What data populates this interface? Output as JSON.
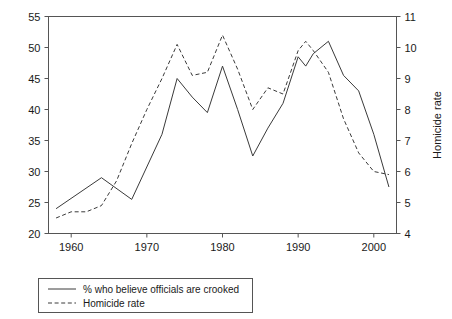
{
  "chart_data": {
    "type": "line",
    "title": "",
    "xlabel": "",
    "ylabel": "",
    "ylabel_right": "Homicide rate",
    "grid": false,
    "legend_position": "bottom-left",
    "xlim": [
      1957,
      2003
    ],
    "xticks": [
      1960,
      1970,
      1980,
      1990,
      2000
    ],
    "xtick_labels": [
      "1960",
      "1970",
      "1980",
      "1990",
      "2000"
    ],
    "ylim_left": [
      20,
      55
    ],
    "yticks_left": [
      20,
      25,
      30,
      35,
      40,
      45,
      50,
      55
    ],
    "ytick_labels_left": [
      "20",
      "25",
      "30",
      "35",
      "40",
      "45",
      "50",
      "55"
    ],
    "ylim_right": [
      4,
      11
    ],
    "yticks_right": [
      4,
      5,
      6,
      7,
      8,
      9,
      10,
      11
    ],
    "ytick_labels_right": [
      "4",
      "5",
      "6",
      "7",
      "8",
      "9",
      "10",
      "11"
    ],
    "series": [
      {
        "name": "% who believe officials are crooked",
        "style": "solid",
        "axis": "left",
        "x": [
          1958,
          1964,
          1968,
          1972,
          1974,
          1976,
          1978,
          1980,
          1982,
          1984,
          1986,
          1988,
          1990,
          1991,
          1992,
          1994,
          1996,
          1998,
          2000,
          2002
        ],
        "values": [
          24.0,
          29.0,
          25.5,
          36.0,
          45.0,
          42.0,
          39.5,
          47.0,
          40.0,
          32.5,
          37.0,
          41.0,
          48.5,
          47.0,
          49.0,
          51.0,
          45.5,
          43.0,
          36.0,
          27.5
        ]
      },
      {
        "name": "Homicide rate",
        "style": "dashed",
        "axis": "right",
        "x": [
          1958,
          1960,
          1962,
          1964,
          1966,
          1968,
          1970,
          1972,
          1974,
          1976,
          1978,
          1980,
          1982,
          1984,
          1986,
          1988,
          1990,
          1991,
          1992,
          1994,
          1996,
          1998,
          2000,
          2002
        ],
        "values": [
          4.5,
          4.7,
          4.7,
          4.9,
          5.7,
          6.9,
          8.0,
          9.0,
          10.1,
          9.1,
          9.2,
          10.4,
          9.3,
          8.0,
          8.7,
          8.5,
          9.9,
          10.2,
          9.9,
          9.2,
          7.7,
          6.6,
          6.0,
          5.9
        ]
      }
    ]
  },
  "legend": {
    "items": [
      {
        "label": "% who believe officials are crooked",
        "style": "solid"
      },
      {
        "label": "Homicide rate",
        "style": "dashed"
      }
    ]
  }
}
